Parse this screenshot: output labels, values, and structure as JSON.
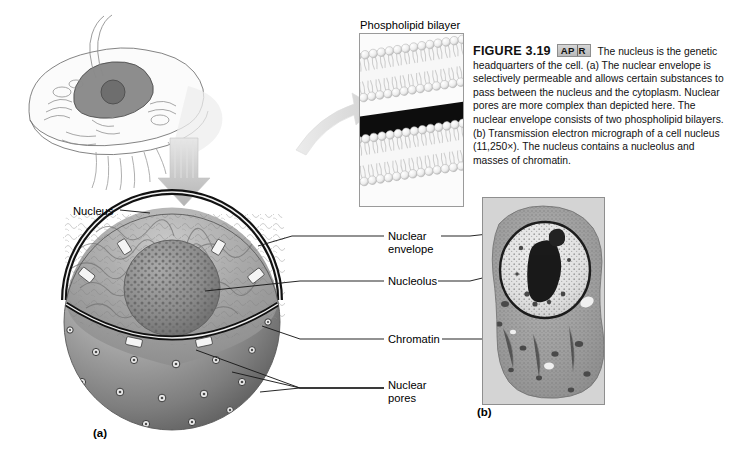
{
  "figure": {
    "number": "FIGURE 3.19",
    "badge": {
      "left": "AP",
      "right": "R"
    },
    "caption": "The nucleus is the genetic headquarters of the cell. (a) The nuclear envelope is selectively permeable and allows certain substances to pass between the nucleus and the cytoplasm. Nuclear pores are more complex than depicted here. The nuclear envelope consists of two phospholipid bilayers. (b) Transmission electron micrograph of a cell nucleus (11,250×). The nucleus contains a nucleolus and masses of chromatin."
  },
  "insets": {
    "bilayer_title": "Phospholipid bilayer"
  },
  "panels": {
    "a": "(a)",
    "b": "(b)"
  },
  "labels": {
    "nucleus": "Nucleus",
    "nuclear_envelope": "Nuclear\nenvelope",
    "nucleolus": "Nucleolus",
    "chromatin": "Chromatin",
    "nuclear_pores": "Nuclear\npores"
  },
  "colors": {
    "background": "#ffffff",
    "text": "#000000",
    "leader_line": "#1a1a1a",
    "badge_fill": "#c8c8c8",
    "arrow_gray": "#cfcfcf",
    "envelope_dark": "#111111",
    "nucleus_body": "#9a9a9a",
    "micrograph_bg": "#cfcfcf"
  }
}
